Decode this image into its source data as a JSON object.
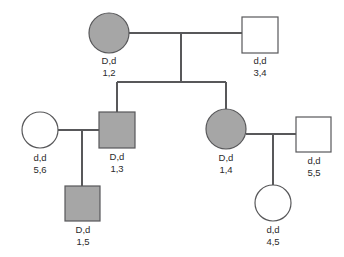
{
  "diagram": {
    "type": "pedigree",
    "title": "",
    "background_color": "#ffffff",
    "line_color": "#58585a",
    "affected_fill": "#a6a6a6",
    "unaffected_fill": "#ffffff",
    "legend": {
      "shaded_means": "affected",
      "circle_means": "female",
      "square_means": "male"
    }
  },
  "individuals": [
    {
      "id": "i1",
      "generation": 1,
      "sex": "female",
      "shape": "circle",
      "affected": true,
      "genotype": "D,d",
      "markers": "1,2",
      "cx": 109,
      "cy": 33,
      "r": 20
    },
    {
      "id": "i2",
      "generation": 1,
      "sex": "male",
      "shape": "square",
      "affected": false,
      "genotype": "d,d",
      "markers": "3,4",
      "x": 242,
      "y": 17,
      "size": 36
    },
    {
      "id": "i3",
      "generation": 2,
      "sex": "female",
      "shape": "circle",
      "affected": false,
      "genotype": "d,d",
      "markers": "5,6",
      "cx": 40,
      "cy": 130,
      "r": 18
    },
    {
      "id": "i4",
      "generation": 2,
      "sex": "male",
      "shape": "square",
      "affected": true,
      "genotype": "D,d",
      "markers": "1,3",
      "x": 99,
      "y": 112,
      "size": 36
    },
    {
      "id": "i5",
      "generation": 2,
      "sex": "female",
      "shape": "circle",
      "affected": true,
      "genotype": "D,d",
      "markers": "1,4",
      "cx": 226,
      "cy": 129,
      "r": 20
    },
    {
      "id": "i6",
      "generation": 2,
      "sex": "male",
      "shape": "square",
      "affected": false,
      "genotype": "d,d",
      "markers": "5,5",
      "x": 296,
      "y": 117,
      "size": 35
    },
    {
      "id": "i7",
      "generation": 3,
      "sex": "male",
      "shape": "square",
      "affected": true,
      "genotype": "D,d",
      "markers": "1,5",
      "x": 65,
      "y": 186,
      "size": 35
    },
    {
      "id": "i8",
      "generation": 3,
      "sex": "female",
      "shape": "circle",
      "affected": false,
      "genotype": "d,d",
      "markers": "4,5",
      "cx": 273,
      "cy": 203,
      "r": 18
    }
  ],
  "labels": {
    "i1": {
      "genotype": "D,d",
      "markers": "1,2"
    },
    "i2": {
      "genotype": "d,d",
      "markers": "3,4"
    },
    "i3": {
      "genotype": "d,d",
      "markers": "5,6"
    },
    "i4": {
      "genotype": "D,d",
      "markers": "1,3"
    },
    "i5": {
      "genotype": "D,d",
      "markers": "1,4"
    },
    "i6": {
      "genotype": "d,d",
      "markers": "5,5"
    },
    "i7": {
      "genotype": "D,d",
      "markers": "1,5"
    },
    "i8": {
      "genotype": "d,d",
      "markers": "4,5"
    }
  },
  "connections": [
    {
      "name": "mating-line-gen1",
      "from": "i1",
      "to": "i2"
    },
    {
      "name": "sibship-drop-gen1",
      "from": "mating-line-gen1",
      "to": "sibship-line-gen2"
    },
    {
      "name": "sibship-line-gen2",
      "children": [
        "i4",
        "i5"
      ]
    },
    {
      "name": "mating-line-left-gen2",
      "from": "i3",
      "to": "i4"
    },
    {
      "name": "child-drop-left",
      "from": "mating-line-left-gen2",
      "to": "i7"
    },
    {
      "name": "mating-line-right-gen2",
      "from": "i5",
      "to": "i6"
    },
    {
      "name": "child-drop-right",
      "from": "mating-line-right-gen2",
      "to": "i8"
    }
  ]
}
